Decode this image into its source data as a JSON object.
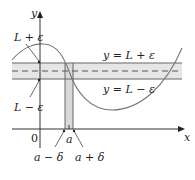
{
  "diagram": {
    "type": "epsilon-delta limit illustration",
    "axes": {
      "x_label": "x",
      "y_label": "y",
      "origin_label": "0"
    },
    "labels": {
      "upper_left": "L + ε",
      "lower_left": "L − ε",
      "upper_line": "y = L + ε",
      "lower_line": "y = L − ε",
      "a": "a",
      "a_minus_delta": "a − δ",
      "a_plus_delta": "a + δ"
    },
    "colors": {
      "band_fill": "#e6e6e6",
      "strip_fill": "#d9d9d9",
      "line": "#555555",
      "curve": "#666666",
      "axis": "#333333"
    }
  }
}
